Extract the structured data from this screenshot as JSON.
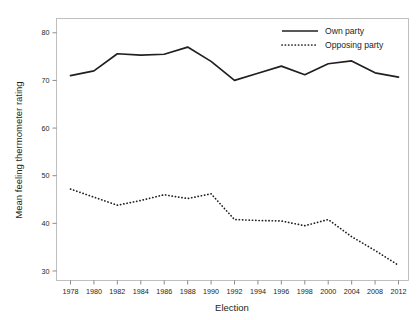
{
  "chart_data": {
    "type": "line",
    "title": "",
    "xlabel": "Election",
    "ylabel": "Mean feeling thermometer rating",
    "categories": [
      "1978",
      "1980",
      "1982",
      "1984",
      "1986",
      "1988",
      "1990",
      "1992",
      "1994",
      "1996",
      "1998",
      "2000",
      "2004",
      "2008",
      "2012"
    ],
    "ylim": [
      28,
      83
    ],
    "yticks": [
      30,
      40,
      50,
      60,
      70,
      80
    ],
    "ytick_labels": [
      "30",
      "40",
      "50",
      "60",
      "70",
      "80"
    ],
    "grid": false,
    "legend_position": "top-right",
    "series": [
      {
        "name": "Own party",
        "style": "solid",
        "color": "#231f20",
        "values": [
          71.0,
          72.0,
          75.6,
          75.3,
          75.5,
          77.0,
          74.0,
          70.0,
          71.5,
          73.0,
          71.2,
          73.5,
          74.1,
          71.6,
          70.7
        ]
      },
      {
        "name": "Opposing party",
        "style": "dotted",
        "color": "#231f20",
        "values": [
          47.2,
          45.5,
          43.8,
          44.8,
          46.0,
          45.2,
          46.2,
          40.8,
          40.6,
          40.5,
          39.5,
          40.8,
          37.2,
          34.3,
          31.2
        ]
      }
    ]
  },
  "legend": {
    "items": [
      {
        "label": "Own party"
      },
      {
        "label": "Opposing party"
      }
    ]
  },
  "axes": {
    "x_title": "Election",
    "y_title": "Mean feeling thermometer rating"
  }
}
